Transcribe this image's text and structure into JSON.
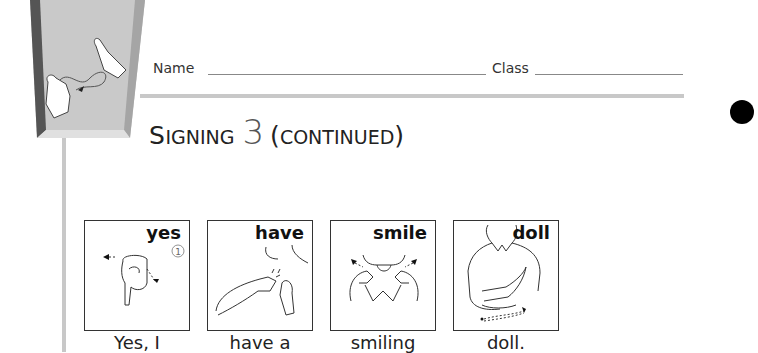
{
  "header": {
    "name_label": "Name",
    "class_label": "Class"
  },
  "title": {
    "first_letter": "S",
    "rest": "IGNING",
    "number": "3",
    "open_paren": "(",
    "continued": "CONTINUED",
    "close_paren": ")"
  },
  "cards": [
    {
      "word": "yes",
      "caption": "Yes, I",
      "step_marker": "1"
    },
    {
      "word": "have",
      "caption": "have a"
    },
    {
      "word": "smile",
      "caption": "smiling"
    },
    {
      "word": "doll",
      "caption": "doll."
    }
  ]
}
